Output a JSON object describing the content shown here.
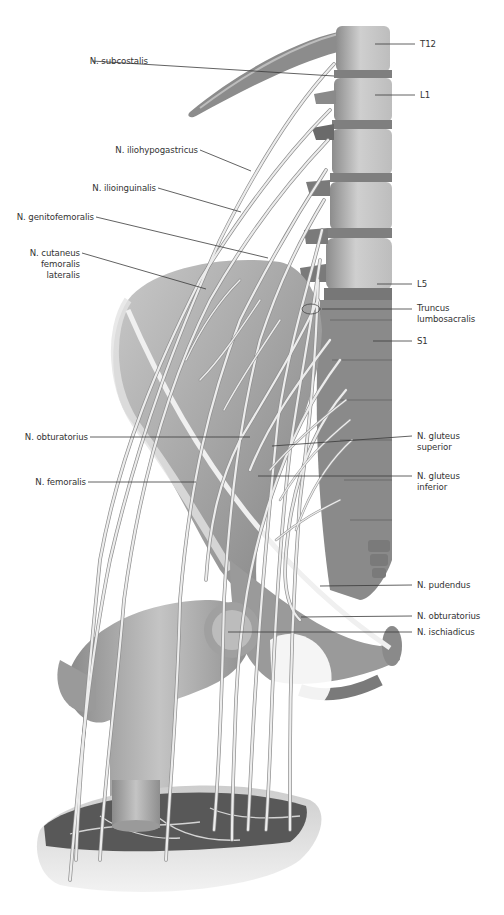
{
  "figure": {
    "colors": {
      "bone_light": "#d8d8d8",
      "bone_mid": "#a8a8a8",
      "bone_dark": "#6e6e6e",
      "muscle": "#5a5a5a",
      "nerve": "#ececec",
      "nerve_edge": "#9a9a9a",
      "label_text": "#333333",
      "leader": "#3a3a3a"
    }
  },
  "labels_left": [
    {
      "id": "subcostalis",
      "text": "N. subcostalis",
      "x": 90,
      "y": 62,
      "anchor": [
        334,
        76
      ]
    },
    {
      "id": "iliohypogastricus",
      "text": "N. iliohypogastricus",
      "x": 112,
      "y": 150,
      "anchor": [
        251,
        171
      ]
    },
    {
      "id": "ilioinguinalis",
      "text": "N. ilioinguinalis",
      "x": 92,
      "y": 188,
      "anchor": [
        241,
        212
      ]
    },
    {
      "id": "genitofemoralis",
      "text": "N. genitofemoralis",
      "x": 40,
      "y": 217,
      "anchor": [
        268,
        258
      ]
    },
    {
      "id": "cutaneus",
      "text": "N. cutaneus\nfemoralis\nlateralis",
      "x": 26,
      "y": 253,
      "anchor": [
        206,
        289
      ]
    },
    {
      "id": "obturatorius_left",
      "text": "N. obturatorius",
      "x": 16,
      "y": 432,
      "anchor": [
        250,
        437
      ]
    },
    {
      "id": "femoralis",
      "text": "N. femoralis",
      "x": 34,
      "y": 477,
      "anchor": [
        196,
        482
      ]
    }
  ],
  "labels_right": [
    {
      "id": "T12",
      "text": "T12",
      "x": 420,
      "y": 40,
      "anchor": [
        375,
        44
      ]
    },
    {
      "id": "L1",
      "text": "L1",
      "x": 420,
      "y": 91,
      "anchor": [
        375,
        95
      ]
    },
    {
      "id": "L5",
      "text": "L5",
      "x": 417,
      "y": 280,
      "anchor": [
        377,
        284
      ]
    },
    {
      "id": "truncus",
      "text": "Truncus\nlumbosacralis",
      "x": 417,
      "y": 304,
      "anchor": [
        322,
        309
      ]
    },
    {
      "id": "S1",
      "text": "S1",
      "x": 417,
      "y": 338,
      "anchor": [
        373,
        341
      ]
    },
    {
      "id": "gluteus_sup",
      "text": "N. gluteus\nsuperior",
      "x": 417,
      "y": 431,
      "anchor": [
        272,
        446
      ]
    },
    {
      "id": "gluteus_inf",
      "text": "N. gluteus\ninferior",
      "x": 417,
      "y": 471,
      "anchor": [
        258,
        476
      ]
    },
    {
      "id": "pudendus",
      "text": "N. pudendus",
      "x": 417,
      "y": 581,
      "anchor": [
        320,
        586
      ]
    },
    {
      "id": "obturatorius_right",
      "text": "N. obturatorius",
      "x": 417,
      "y": 612,
      "anchor": [
        301,
        617
      ]
    },
    {
      "id": "ischiadicus",
      "text": "N. ischiadicus",
      "x": 417,
      "y": 628,
      "anchor": [
        228,
        632
      ]
    }
  ]
}
